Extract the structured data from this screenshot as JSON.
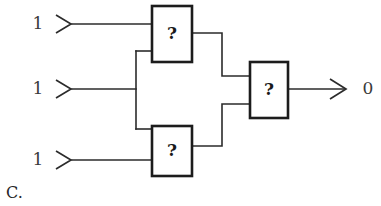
{
  "figure": {
    "caption": "C.",
    "background_color": "#ffffff",
    "line_color": "#2b2b2b",
    "box_stroke_color": "#1c1c1c",
    "text_color": "#262626"
  },
  "inputs": [
    {
      "name": "input-top",
      "label": "1",
      "label_x": 38,
      "label_y": 24,
      "marker_x": 58,
      "marker_y": 24,
      "wire_y": 24
    },
    {
      "name": "input-middle",
      "label": "1",
      "label_x": 38,
      "label_y": 89,
      "marker_x": 58,
      "marker_y": 89,
      "wire_y": 89
    },
    {
      "name": "input-bottom",
      "label": "1",
      "label_x": 38,
      "label_y": 160,
      "marker_x": 58,
      "marker_y": 160,
      "wire_y": 160
    }
  ],
  "gates": [
    {
      "name": "gate-top",
      "label": "?",
      "x": 152,
      "y": 6,
      "width": 40,
      "height": 56
    },
    {
      "name": "gate-bottom",
      "label": "?",
      "x": 152,
      "y": 126,
      "width": 40,
      "height": 50
    },
    {
      "name": "gate-output",
      "label": "?",
      "x": 250,
      "y": 62,
      "width": 38,
      "height": 56
    }
  ],
  "output": {
    "name": "output-line",
    "label": "0",
    "label_x": 368,
    "label_y": 89,
    "marker_x": 344,
    "marker_y": 89,
    "wire_y": 89
  },
  "wires": [
    {
      "name": "wire-input-top-to-gate-top",
      "d": "M 72 24 L 152 24"
    },
    {
      "name": "wire-input-mid-to-bus",
      "d": "M 72 89 L 136 89"
    },
    {
      "name": "wire-bus-vertical",
      "d": "M 136 51 L 136 129"
    },
    {
      "name": "wire-bus-to-gate-top",
      "d": "M 136 51 L 152 51"
    },
    {
      "name": "wire-bus-to-gate-bottom",
      "d": "M 136 129 L 152 129"
    },
    {
      "name": "wire-input-bottom-to-gate",
      "d": "M 72 160 L 152 160"
    },
    {
      "name": "wire-gate-top-to-output-gate",
      "d": "M 192 33 L 222 33 L 222 76 L 250 76"
    },
    {
      "name": "wire-gate-bottom-to-output",
      "d": "M 192 146 L 222 146 L 222 104 L 250 104"
    },
    {
      "name": "wire-output-gate-to-arrow",
      "d": "M 288 89 L 344 89"
    }
  ],
  "markers": [
    {
      "name": "input-marker-top",
      "d": "M 56 15 L 71 24 L 56 33"
    },
    {
      "name": "input-marker-middle",
      "d": "M 56 80 L 71 89 L 56 98"
    },
    {
      "name": "input-marker-bottom",
      "d": "M 56 151 L 71 160 L 56 169"
    },
    {
      "name": "output-marker",
      "d": "M 330 79 L 346 89 L 330 99"
    }
  ],
  "caption": {
    "text": "C.",
    "x": 6,
    "y": 193
  }
}
